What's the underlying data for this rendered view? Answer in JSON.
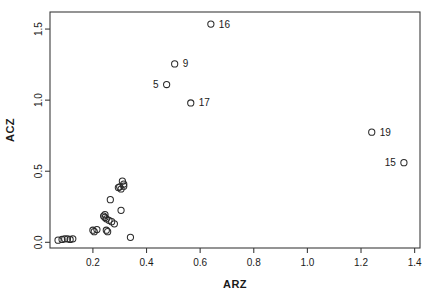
{
  "figure": {
    "background_color": "#ffffff",
    "foreground_color": "#1a1a1a",
    "point_stroke_color": "#2a2a2a"
  },
  "chart_data": {
    "type": "scatter",
    "title": "",
    "xlabel": "ARZ",
    "ylabel": "ACZ",
    "xlim": [
      0.04,
      1.42
    ],
    "ylim": [
      -0.04,
      1.62
    ],
    "xticks": [
      0.2,
      0.4,
      0.6,
      0.8,
      1.0,
      1.2,
      1.4
    ],
    "xtick_labels": [
      "0.2",
      "0.4",
      "0.6",
      "0.8",
      "1.0",
      "1.2",
      "1.4"
    ],
    "yticks": [
      0.0,
      0.5,
      1.0,
      1.5
    ],
    "ytick_labels": [
      "0.0",
      "0.5",
      "1.0",
      "1.5"
    ],
    "grid": false,
    "legend": null,
    "marker": "open-circle",
    "points": [
      {
        "x": 0.07,
        "y": 0.015,
        "label": ""
      },
      {
        "x": 0.085,
        "y": 0.02,
        "label": ""
      },
      {
        "x": 0.095,
        "y": 0.025,
        "label": ""
      },
      {
        "x": 0.105,
        "y": 0.025,
        "label": ""
      },
      {
        "x": 0.115,
        "y": 0.02,
        "label": ""
      },
      {
        "x": 0.125,
        "y": 0.025,
        "label": ""
      },
      {
        "x": 0.2,
        "y": 0.085,
        "label": ""
      },
      {
        "x": 0.205,
        "y": 0.075,
        "label": ""
      },
      {
        "x": 0.215,
        "y": 0.09,
        "label": ""
      },
      {
        "x": 0.24,
        "y": 0.185,
        "label": ""
      },
      {
        "x": 0.245,
        "y": 0.195,
        "label": ""
      },
      {
        "x": 0.245,
        "y": 0.175,
        "label": ""
      },
      {
        "x": 0.25,
        "y": 0.165,
        "label": ""
      },
      {
        "x": 0.25,
        "y": 0.085,
        "label": ""
      },
      {
        "x": 0.255,
        "y": 0.075,
        "label": ""
      },
      {
        "x": 0.26,
        "y": 0.155,
        "label": ""
      },
      {
        "x": 0.265,
        "y": 0.3,
        "label": ""
      },
      {
        "x": 0.27,
        "y": 0.145,
        "label": ""
      },
      {
        "x": 0.28,
        "y": 0.13,
        "label": ""
      },
      {
        "x": 0.295,
        "y": 0.385,
        "label": ""
      },
      {
        "x": 0.3,
        "y": 0.39,
        "label": ""
      },
      {
        "x": 0.305,
        "y": 0.375,
        "label": ""
      },
      {
        "x": 0.305,
        "y": 0.225,
        "label": ""
      },
      {
        "x": 0.31,
        "y": 0.43,
        "label": ""
      },
      {
        "x": 0.315,
        "y": 0.41,
        "label": ""
      },
      {
        "x": 0.315,
        "y": 0.395,
        "label": ""
      },
      {
        "x": 0.34,
        "y": 0.035,
        "label": ""
      },
      {
        "x": 0.475,
        "y": 1.11,
        "label": "5",
        "label_side": "left"
      },
      {
        "x": 0.505,
        "y": 1.255,
        "label": "9",
        "label_side": "right"
      },
      {
        "x": 0.565,
        "y": 0.98,
        "label": "17",
        "label_side": "right"
      },
      {
        "x": 0.64,
        "y": 1.535,
        "label": "16",
        "label_side": "right"
      },
      {
        "x": 1.24,
        "y": 0.775,
        "label": "19",
        "label_side": "right"
      },
      {
        "x": 1.36,
        "y": 0.56,
        "label": "15",
        "label_side": "left"
      }
    ]
  }
}
